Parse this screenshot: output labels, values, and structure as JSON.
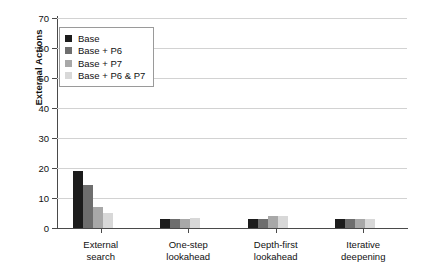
{
  "chart_data": {
    "type": "bar",
    "title": "",
    "xlabel": "",
    "ylabel": "External Actions",
    "ylim": [
      0,
      70
    ],
    "yticks": [
      0,
      10,
      20,
      30,
      40,
      50,
      60,
      70
    ],
    "grid": "horizontal",
    "legend_position": "upper left inside plot",
    "categories": [
      "External\nsearch",
      "One-step\nlookahead",
      "Depth-first\nlookahead",
      "Iterative\ndeepening"
    ],
    "series": [
      {
        "name": "Base",
        "color": "#1c1c1c",
        "values": [
          19,
          3,
          3,
          3
        ]
      },
      {
        "name": "Base + P6",
        "color": "#6e6e6e",
        "values": [
          14.5,
          3,
          3,
          3
        ]
      },
      {
        "name": "Base + P7",
        "color": "#a8a8a8",
        "values": [
          7,
          3,
          4,
          3
        ]
      },
      {
        "name": "Base + P6 & P7",
        "color": "#d8d8d8",
        "values": [
          5,
          3.5,
          4,
          3
        ]
      }
    ]
  },
  "axis": {
    "y_title": "External Actions",
    "y_tick_labels": [
      "0",
      "10",
      "20",
      "30",
      "40",
      "50",
      "60",
      "70"
    ]
  },
  "legend": {
    "items": [
      {
        "label": "Base"
      },
      {
        "label": "Base + P6"
      },
      {
        "label": "Base + P7"
      },
      {
        "label": "Base + P6 & P7"
      }
    ]
  },
  "categories": [
    {
      "line1": "External",
      "line2": "search"
    },
    {
      "line1": "One-step",
      "line2": "lookahead"
    },
    {
      "line1": "Depth-first",
      "line2": "lookahead"
    },
    {
      "line1": "Iterative",
      "line2": "deepening"
    }
  ]
}
